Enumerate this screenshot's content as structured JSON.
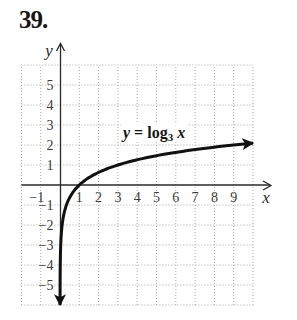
{
  "problem": {
    "number": "39."
  },
  "graph": {
    "x_axis_label": "x",
    "y_axis_label": "y",
    "equation": {
      "lhs": "y",
      "equals": " = ",
      "func": "log",
      "base": "3",
      "arg": "x"
    }
  },
  "colors": {
    "curve": "#111111",
    "axes": "#2a2a2a",
    "grid": "#a8a8a8",
    "tick_text": "#3a3a3a",
    "background": "#ffffff"
  },
  "chart_data": {
    "type": "line",
    "title": "",
    "xlabel": "x",
    "ylabel": "y",
    "xlim": [
      -2,
      10
    ],
    "ylim": [
      -6,
      6
    ],
    "grid": true,
    "grid_style": "dotted",
    "x_ticks": [
      -1,
      1,
      2,
      3,
      4,
      5,
      6,
      7,
      8,
      9
    ],
    "x_tick_labels": [
      "−1",
      "1",
      "2",
      "3",
      "4",
      "5",
      "6",
      "7",
      "8",
      "9"
    ],
    "y_ticks": [
      -5,
      -4,
      -3,
      -2,
      -1,
      1,
      2,
      3,
      4,
      5
    ],
    "y_tick_labels": [
      "−5",
      "−4",
      "−3",
      "−2",
      "−1",
      "1",
      "2",
      "3",
      "4",
      "5"
    ],
    "series": [
      {
        "name": "y = log3 x",
        "function": "log_3(x)",
        "log_base": 3,
        "x": [
          0.0014,
          0.0041,
          0.0123,
          0.037,
          0.111,
          0.333,
          1,
          3,
          9,
          10
        ],
        "y": [
          -6,
          -5,
          -4,
          -3,
          -2,
          -1,
          0,
          1,
          2,
          2.096
        ],
        "x_end": 10,
        "arrows": "both ends",
        "color": "#111111"
      }
    ],
    "annotations": [
      {
        "text": "y = log3 x",
        "x": 5.3,
        "y": 2.55
      }
    ],
    "legend": null
  }
}
